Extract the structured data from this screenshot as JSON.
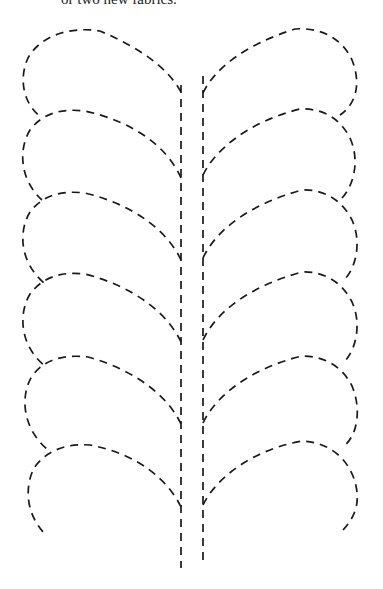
{
  "document": {
    "caption": "or two new fabrics."
  },
  "pattern": {
    "name": "feather-quilting-template",
    "line_style": "dashed",
    "stroke_color": "#1a1a1a",
    "left_side": {
      "leaf_count": 6,
      "stem_x": 181
    },
    "right_side": {
      "leaf_count": 6,
      "stem_x": 203
    }
  }
}
